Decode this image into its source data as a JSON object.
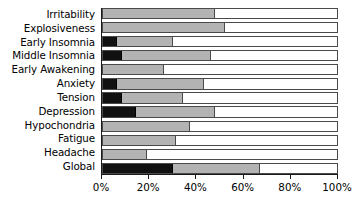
{
  "chart_data": {
    "type": "bar",
    "orientation": "horizontal",
    "stacked": true,
    "title": "",
    "xlabel": "",
    "ylabel": "",
    "xlim": [
      0,
      100
    ],
    "xticks": [
      0,
      20,
      40,
      60,
      80,
      100
    ],
    "xtick_labels": [
      "0%",
      "20%",
      "40%",
      "60%",
      "80%",
      "100%"
    ],
    "grid": false,
    "legend": "none",
    "categories": [
      "Irritability",
      "Explosiveness",
      "Early Insomnia",
      "Middle Insomnia",
      "Early Awakening",
      "Anxiety",
      "Tension",
      "Depression",
      "Hypochondria",
      "Fatigue",
      "Headache",
      "Global"
    ],
    "series": [
      {
        "name": "severe",
        "color": "#111111",
        "values": [
          0,
          0,
          6,
          8,
          0,
          6,
          8,
          14,
          0,
          0,
          0,
          30
        ]
      },
      {
        "name": "moderate",
        "color": "#b3b3b3",
        "values": [
          48,
          52,
          24,
          38,
          26,
          37,
          26,
          34,
          37,
          31,
          19,
          37
        ]
      },
      {
        "name": "none",
        "color": "#ffffff",
        "values": [
          52,
          48,
          70,
          54,
          74,
          57,
          66,
          52,
          63,
          69,
          81,
          33
        ]
      }
    ],
    "cumulative_endpoints": {
      "Irritability": [
        0,
        48,
        100
      ],
      "Explosiveness": [
        0,
        52,
        100
      ],
      "Early Insomnia": [
        6,
        30,
        100
      ],
      "Middle Insomnia": [
        8,
        46,
        100
      ],
      "Early Awakening": [
        0,
        26,
        100
      ],
      "Anxiety": [
        6,
        43,
        100
      ],
      "Tension": [
        8,
        34,
        100
      ],
      "Depression": [
        14,
        48,
        100
      ],
      "Hypochondria": [
        0,
        37,
        100
      ],
      "Fatigue": [
        0,
        31,
        100
      ],
      "Headache": [
        0,
        19,
        100
      ],
      "Global": [
        30,
        67,
        100
      ]
    }
  }
}
